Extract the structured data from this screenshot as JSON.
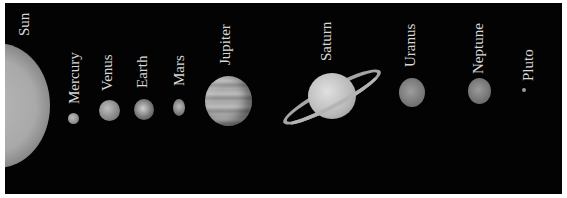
{
  "image": {
    "description": "Solar system illustration (not to scale), grayscale, black background",
    "labels": {
      "sun": "Sun",
      "mercury": "Mercury",
      "venus": "Venus",
      "earth": "Earth",
      "mars": "Mars",
      "jupiter": "Jupiter",
      "saturn": "Saturn",
      "uranus": "Uranus",
      "neptune": "Neptune",
      "pluto": "Pluto"
    },
    "colors": {
      "background": "#030303",
      "label": "#d8d8d8",
      "frame": "#ffffff"
    }
  }
}
